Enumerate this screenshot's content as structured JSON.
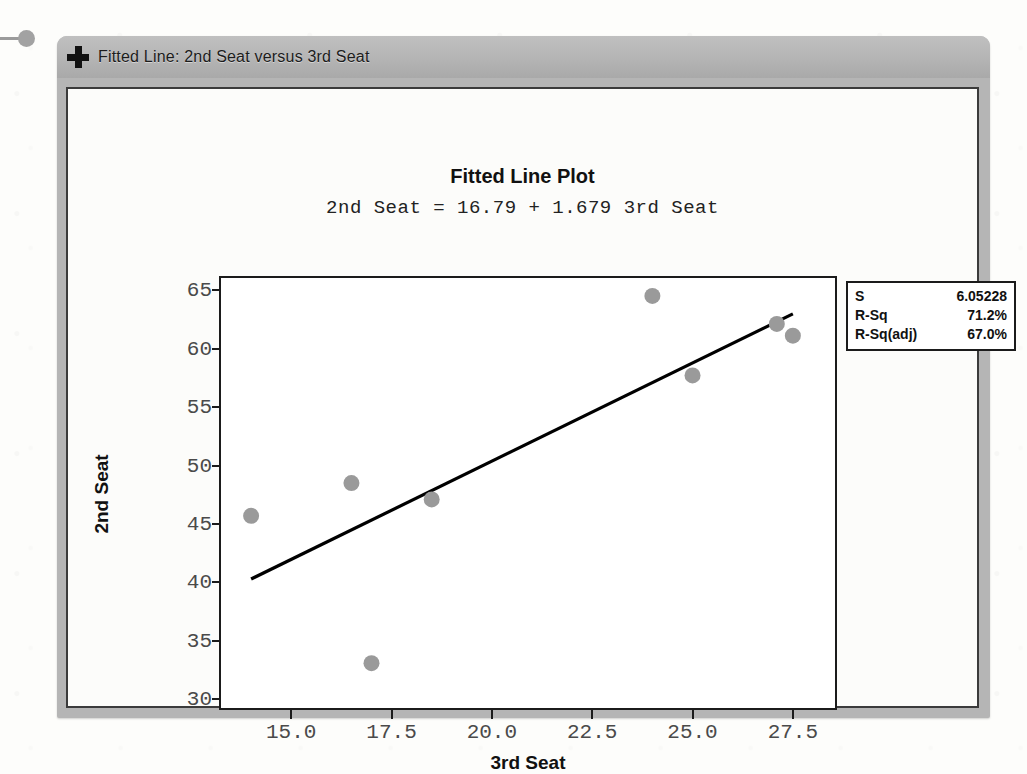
{
  "window": {
    "title": "Fitted Line: 2nd Seat versus 3rd Seat",
    "icon": "plus-icon"
  },
  "chart_data": {
    "type": "scatter",
    "title": "Fitted Line Plot",
    "subtitle": "2nd Seat = 16.79 + 1.679 3rd Seat",
    "xlabel": "3rd Seat",
    "ylabel": "2nd Seat",
    "xlim": [
      13.2,
      28.6
    ],
    "ylim": [
      29.1,
      66.2
    ],
    "xticks": [
      "15.0",
      "17.5",
      "20.0",
      "22.5",
      "25.0",
      "27.5"
    ],
    "xtick_values": [
      15.0,
      17.5,
      20.0,
      22.5,
      25.0,
      27.5
    ],
    "yticks": [
      "30",
      "35",
      "40",
      "45",
      "50",
      "55",
      "60",
      "65"
    ],
    "ytick_values": [
      30,
      35,
      40,
      45,
      50,
      55,
      60,
      65
    ],
    "grid": false,
    "legend_position": "outside-right-top",
    "point_color": "#9a9a9a",
    "line_color": "#000000",
    "points": [
      {
        "x": 14.0,
        "y": 45.7
      },
      {
        "x": 16.5,
        "y": 48.5
      },
      {
        "x": 17.0,
        "y": 33.1
      },
      {
        "x": 18.5,
        "y": 47.1
      },
      {
        "x": 24.0,
        "y": 64.5
      },
      {
        "x": 25.0,
        "y": 57.7
      },
      {
        "x": 27.1,
        "y": 62.1
      },
      {
        "x": 27.5,
        "y": 61.1
      }
    ],
    "fit_line": {
      "intercept": 16.79,
      "slope": 1.679,
      "x_start": 14.0,
      "x_end": 27.5
    },
    "annotations": [
      {
        "label": "S",
        "value": "6.05228"
      },
      {
        "label": "R-Sq",
        "value": "71.2%"
      },
      {
        "label": "R-Sq(adj)",
        "value": "67.0%"
      }
    ]
  },
  "stats": {
    "rows": [
      {
        "key": "S",
        "value": "6.05228"
      },
      {
        "key": "R-Sq",
        "value": "71.2%"
      },
      {
        "key": "R-Sq(adj)",
        "value": "67.0%"
      }
    ]
  }
}
